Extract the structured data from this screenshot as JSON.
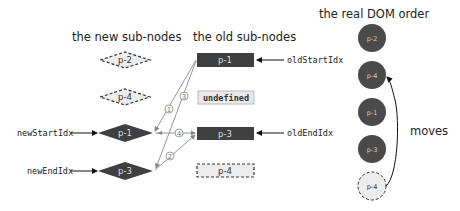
{
  "titles": {
    "new_nodes": "the new sub-nodes",
    "old_nodes": "the old sub-nodes",
    "real_dom": "the real DOM order"
  },
  "new_nodes": [
    {
      "label": "p-2",
      "style": "dashed"
    },
    {
      "label": "p-4",
      "style": "dashed"
    },
    {
      "label": "p-1",
      "style": "solid"
    },
    {
      "label": "p-3",
      "style": "solid"
    }
  ],
  "old_nodes": [
    {
      "label": "p-1",
      "style": "solid"
    },
    {
      "label": "undefined",
      "style": "light"
    },
    {
      "label": "p-3",
      "style": "solid"
    },
    {
      "label": "p-4",
      "style": "dashed"
    }
  ],
  "pointers": {
    "new_start": "newStartIdx",
    "new_end": "newEndIdx",
    "old_start": "oldStartIdx",
    "old_end": "oldEndIdx"
  },
  "comparison_steps": [
    "1",
    "2",
    "3",
    "4"
  ],
  "real_dom": [
    {
      "label": "p-2",
      "style": "solid"
    },
    {
      "label": "p-4",
      "style": "solid"
    },
    {
      "label": "p-1",
      "style": "solid"
    },
    {
      "label": "p-3",
      "style": "solid"
    },
    {
      "label": "p-4",
      "style": "dashed"
    }
  ],
  "moves_label": "moves",
  "colors": {
    "node_dark": "#3f3f3f",
    "node_light": "#e8e8e8",
    "arrow": "#8a8a8a",
    "text": "#222222"
  }
}
